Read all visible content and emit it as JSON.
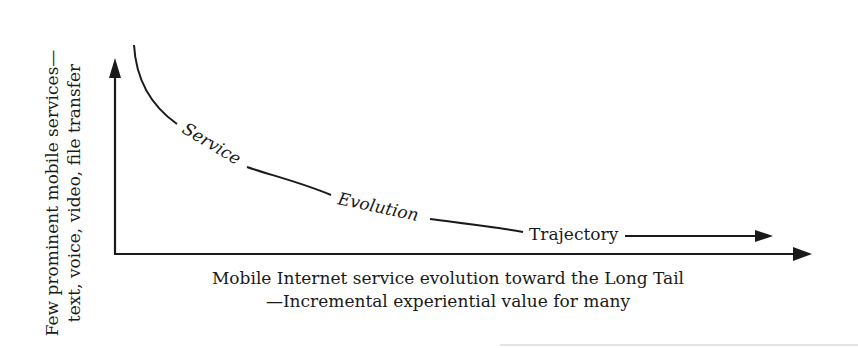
{
  "diagram": {
    "type": "long-tail-trajectory",
    "y_axis": {
      "label_line1": "Few prominent mobile services—",
      "label_line2": "text, voice, video, file transfer"
    },
    "x_axis": {
      "label_line1": "Mobile Internet service evolution toward the Long Tail",
      "label_line2": "—Incremental experiential value for many"
    },
    "curve": {
      "labels": [
        "Service",
        "Evolution",
        "Trajectory"
      ]
    },
    "colors": {
      "ink": "#1a1a1a",
      "background": "#ffffff",
      "rule": "#bbbbbb"
    }
  }
}
